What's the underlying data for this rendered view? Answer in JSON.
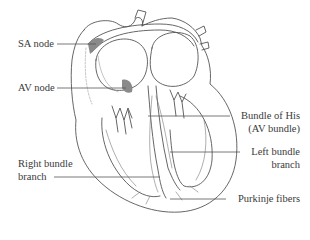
{
  "diagram": {
    "colors": {
      "outline": "#555555",
      "node_fill": "#8a8a8a",
      "leader_line": "#555555",
      "text": "#3a3a3a",
      "background": "#ffffff"
    },
    "labels": {
      "sa_node": "SA node",
      "av_node": "AV node",
      "bundle_of_his_line1": "Bundle of His",
      "bundle_of_his_line2": "(AV bundle)",
      "left_bundle_line1": "Left bundle",
      "left_bundle_line2": "branch",
      "right_bundle_line1": "Right bundle",
      "right_bundle_line2": "branch",
      "purkinje": "Purkinje fibers"
    }
  }
}
